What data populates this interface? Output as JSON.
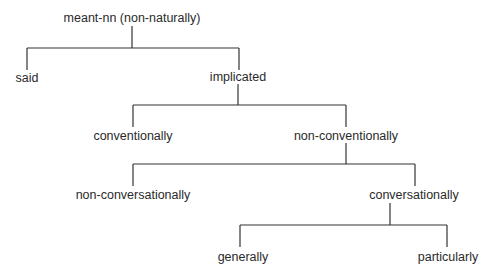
{
  "diagram": {
    "type": "tree",
    "line_color": "#333333",
    "background": "#ffffff",
    "nodes": {
      "root": {
        "label": "meant-nn (non-naturally)"
      },
      "said": {
        "label": "said"
      },
      "implicated": {
        "label": "implicated"
      },
      "conventionally": {
        "label": "conventionally"
      },
      "non_conventionally": {
        "label": "non-conventionally"
      },
      "non_conversationally": {
        "label": "non-conversationally"
      },
      "conversationally": {
        "label": "conversationally"
      },
      "generally": {
        "label": "generally"
      },
      "particularly": {
        "label": "particularly"
      }
    },
    "edges": [
      [
        "meant-nn (non-naturally)",
        "said"
      ],
      [
        "meant-nn (non-naturally)",
        "implicated"
      ],
      [
        "implicated",
        "conventionally"
      ],
      [
        "implicated",
        "non-conventionally"
      ],
      [
        "non-conventionally",
        "non-conversationally"
      ],
      [
        "non-conventionally",
        "conversationally"
      ],
      [
        "conversationally",
        "generally"
      ],
      [
        "conversationally",
        "particularly"
      ]
    ]
  }
}
